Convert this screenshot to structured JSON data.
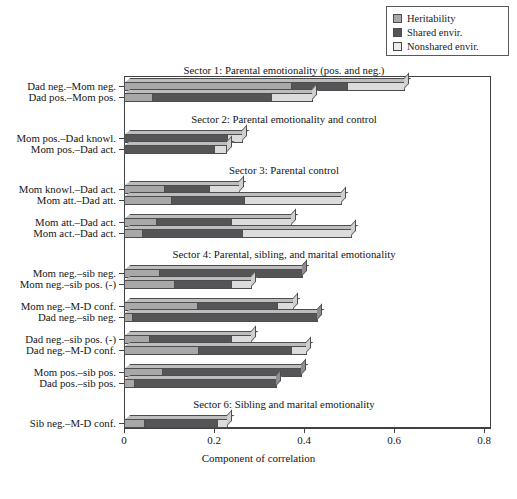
{
  "legend": {
    "position": "top-right",
    "items": [
      {
        "label": "Heritability",
        "key": "h",
        "color": "#a8a8a8"
      },
      {
        "label": "Shared envir.",
        "key": "s",
        "color": "#555557"
      },
      {
        "label": "Nonshared envir.",
        "key": "n",
        "color": "#dcdcdc"
      }
    ]
  },
  "chart_data": {
    "type": "bar",
    "orientation": "horizontal",
    "stacked": true,
    "title": "",
    "xlabel": "Component of correlation",
    "ylabel": "",
    "xlim": [
      0,
      0.8
    ],
    "xticks": [
      "0",
      "0.2",
      "0.4",
      "0.6",
      "0.8"
    ],
    "xtick_values": [
      0,
      0.2,
      0.4,
      0.6,
      0.8
    ],
    "grid": false,
    "legend_position": "top-right",
    "series": [
      {
        "name": "Heritability",
        "key": "h",
        "color": "#a8a8a8"
      },
      {
        "name": "Shared envir.",
        "key": "s",
        "color": "#555557"
      },
      {
        "name": "Nonshared envir.",
        "key": "n",
        "color": "#dcdcdc"
      }
    ],
    "sectors": [
      {
        "title": "Sector 1: Parental emotionality (pos. and neg.)",
        "bars": [
          {
            "category": "Dad neg.–Mom neg.",
            "h": 0.373,
            "s": 0.124,
            "n": 0.127,
            "total": 0.624
          },
          {
            "category": "Dad pos.–Mom pos.",
            "h": 0.065,
            "s": 0.264,
            "n": 0.091,
            "total": 0.42
          }
        ]
      },
      {
        "title": "Sector 2: Parental emotionality  and control",
        "bars": [
          {
            "category": "Mom pos.–Dad knowl.",
            "h": 0.0,
            "s": 0.232,
            "n": 0.032,
            "total": 0.264
          },
          {
            "category": "Mom pos.–Dad act.",
            "h": 0.0,
            "s": 0.202,
            "n": 0.028,
            "total": 0.23
          }
        ]
      },
      {
        "title": "Sector 3: Parental control",
        "bars": [
          {
            "category": "Mom knowl.–Dad act.",
            "h": 0.091,
            "s": 0.1,
            "n": 0.067,
            "total": 0.258
          },
          {
            "category": "Mom att.–Dad att.",
            "h": 0.106,
            "s": 0.163,
            "n": 0.215,
            "total": 0.484
          },
          {
            "category": "Mom att.–Dad act.",
            "h": 0.073,
            "s": 0.167,
            "n": 0.133,
            "total": 0.373
          },
          {
            "category": "Mom act.–Dad act.",
            "h": 0.042,
            "s": 0.222,
            "n": 0.243,
            "total": 0.507
          }
        ]
      },
      {
        "title": "Sector 4: Parental, sibling, and marital emotionality",
        "bars": [
          {
            "category": "Mom neg.–sib neg.",
            "h": 0.08,
            "s": 0.318,
            "n": 0.0,
            "total": 0.398
          },
          {
            "category": "Mom neg.–sib pos. (-)",
            "h": 0.113,
            "s": 0.127,
            "n": 0.044,
            "total": 0.284
          },
          {
            "category": "Mom neg.–M-D conf.",
            "h": 0.164,
            "s": 0.179,
            "n": 0.035,
            "total": 0.378
          },
          {
            "category": "Dad neg.–sib neg.",
            "h": 0.02,
            "s": 0.411,
            "n": 0.0,
            "total": 0.431
          },
          {
            "category": "Dad neg.–sib pos. (-)",
            "h": 0.058,
            "s": 0.182,
            "n": 0.044,
            "total": 0.284
          },
          {
            "category": "Dad neg.–M-D conf.",
            "h": 0.167,
            "s": 0.206,
            "n": 0.034,
            "total": 0.407
          },
          {
            "category": "Mom pos.–sib pos.",
            "h": 0.087,
            "s": 0.309,
            "n": 0.0,
            "total": 0.396
          },
          {
            "category": "Dad pos.–sib pos.",
            "h": 0.024,
            "s": 0.316,
            "n": 0.0,
            "total": 0.34
          }
        ]
      },
      {
        "title": "Sector 6: Sibling and marital emotionality",
        "bars": [
          {
            "category": "Sib neg.–M-D conf.",
            "h": 0.047,
            "s": 0.163,
            "n": 0.022,
            "total": 0.232
          }
        ]
      }
    ]
  }
}
